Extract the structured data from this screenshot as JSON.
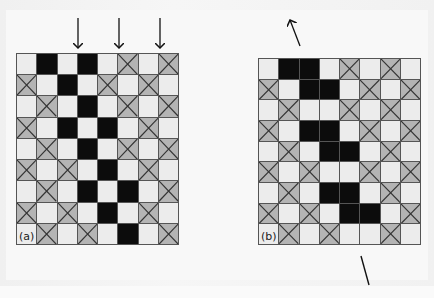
{
  "figure": {
    "panels": [
      {
        "id": "a",
        "label": "(a)",
        "columns": 8,
        "rows": [
          [
            "W",
            "B",
            "W",
            "B",
            "W",
            "X",
            "W",
            "X"
          ],
          [
            "X",
            "W",
            "B",
            "W",
            "X",
            "W",
            "X",
            "W"
          ],
          [
            "W",
            "X",
            "W",
            "B",
            "W",
            "X",
            "W",
            "X"
          ],
          [
            "X",
            "W",
            "B",
            "W",
            "B",
            "W",
            "X",
            "W"
          ],
          [
            "W",
            "X",
            "W",
            "B",
            "W",
            "X",
            "W",
            "X"
          ],
          [
            "X",
            "W",
            "X",
            "W",
            "B",
            "W",
            "X",
            "W"
          ],
          [
            "W",
            "X",
            "W",
            "B",
            "W",
            "B",
            "W",
            "X"
          ],
          [
            "X",
            "W",
            "X",
            "W",
            "B",
            "W",
            "X",
            "W"
          ],
          [
            "L",
            "X",
            "W",
            "X",
            "W",
            "B",
            "W",
            "X"
          ]
        ],
        "annotations": [
          {
            "type": "arrow-down",
            "x": 78,
            "y1": 18,
            "y2": 48
          },
          {
            "type": "arrow-down",
            "x": 119,
            "y1": 18,
            "y2": 48
          },
          {
            "type": "arrow-down",
            "x": 160,
            "y1": 18,
            "y2": 48
          }
        ]
      },
      {
        "id": "b",
        "label": "(b)",
        "columns": 8,
        "rows": [
          [
            "W",
            "B",
            "B",
            "W",
            "X",
            "W",
            "X",
            "W"
          ],
          [
            "X",
            "W",
            "B",
            "B",
            "W",
            "X",
            "W",
            "X"
          ],
          [
            "W",
            "X",
            "W",
            "W",
            "X",
            "W",
            "X",
            "W"
          ],
          [
            "X",
            "W",
            "B",
            "B",
            "W",
            "X",
            "W",
            "X"
          ],
          [
            "W",
            "X",
            "W",
            "B",
            "B",
            "W",
            "X",
            "W"
          ],
          [
            "X",
            "W",
            "X",
            "W",
            "W",
            "X",
            "W",
            "X"
          ],
          [
            "W",
            "X",
            "W",
            "B",
            "B",
            "W",
            "X",
            "W"
          ],
          [
            "X",
            "W",
            "X",
            "W",
            "B",
            "B",
            "W",
            "X"
          ],
          [
            "L",
            "X",
            "W",
            "X",
            "W",
            "W",
            "X",
            "W"
          ]
        ],
        "annotations": [
          {
            "type": "arrow-up-left",
            "x1": 300,
            "y1": 46,
            "x2": 290,
            "y2": 20
          },
          {
            "type": "line",
            "x1": 361,
            "y1": 256,
            "x2": 369,
            "y2": 285
          }
        ]
      }
    ],
    "legend": {
      "W": "light square",
      "B": "black square",
      "X": "grey crossed square",
      "L": "panel label cell"
    },
    "colors": {
      "light": "#ececec",
      "black": "#0c0c0c",
      "crossed": "#b4b4b4",
      "gridline": "#555555"
    }
  }
}
